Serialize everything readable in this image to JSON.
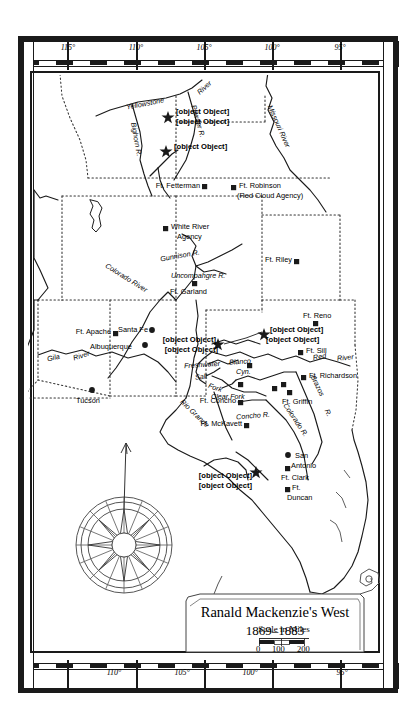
{
  "map": {
    "title": "Ranald Mackenzie's West",
    "date_range": "1869–1883",
    "scale_caption": "Scale in Miles",
    "scale_ticks": [
      "0",
      "100",
      "200"
    ],
    "graticule_top": [
      "115°",
      "110°",
      "105°",
      "100°",
      "95°"
    ],
    "graticule_bottom": [
      "110°",
      "105°",
      "100°",
      "95°"
    ],
    "compass": {
      "name": "compass-rose",
      "points": 16
    },
    "forts": [
      {
        "label": "Ft. Fetterman",
        "marker": "square"
      },
      {
        "label": "Ft. Robinson",
        "marker": "square"
      },
      {
        "label": "(Red Cloud Agency)",
        "marker": "none"
      },
      {
        "label": "White River",
        "marker": "square"
      },
      {
        "label": "Agency",
        "marker": "none"
      },
      {
        "label": "Ft. Riley",
        "marker": "square"
      },
      {
        "label": "Ft. Garland",
        "marker": "square"
      },
      {
        "label": "Ft. Reno",
        "marker": "square"
      },
      {
        "label": "Ft. Apache",
        "marker": "square"
      },
      {
        "label": "Ft. Sill",
        "marker": "square"
      },
      {
        "label": "Ft. Richardson",
        "marker": "square"
      },
      {
        "label": "Ft. Griffin",
        "marker": "square"
      },
      {
        "label": "Ft. Concho",
        "marker": "square"
      },
      {
        "label": "Ft. McKavett",
        "marker": "square"
      },
      {
        "label": "Ft. Clark",
        "marker": "square"
      },
      {
        "label": "Ft.",
        "marker": "square"
      },
      {
        "label": "Duncan",
        "marker": "none"
      }
    ],
    "cities": [
      {
        "label": "Santa Fe",
        "marker": "dot"
      },
      {
        "label": "Albuquerque",
        "marker": "dot"
      },
      {
        "label": "Tucson",
        "marker": "dot"
      },
      {
        "label": "San",
        "marker": "dot"
      },
      {
        "label": "Antonio",
        "marker": "none"
      }
    ],
    "battles": [
      {
        "label": "Custer",
        "marker": "star"
      },
      {
        "label": "fight",
        "marker": "none"
      },
      {
        "label": "Dull Knife fight",
        "marker": "star"
      },
      {
        "label": "Battle of  Palo",
        "marker": "star"
      },
      {
        "label": "Duro Cyn.",
        "marker": "none"
      },
      {
        "label": "Battle of the North",
        "marker": "star"
      },
      {
        "label": "Fork of the Red River",
        "marker": "none"
      },
      {
        "label": "Fight at",
        "marker": "star"
      },
      {
        "label": "El Remolino",
        "marker": "none"
      }
    ],
    "rivers": [
      "Yellowstone",
      "River",
      "Bighorn R.",
      "Powder R.",
      "Missouri River",
      "Colorado River",
      "Gunnison R.",
      "Uncompahgre R.",
      "Gila",
      "River",
      "Rio Grande",
      "Red",
      "River",
      "Freshwater",
      "Salt",
      "Fork",
      "Blanco",
      "Cyn.",
      "Clear Fork",
      "Concho R.",
      "Colorado R.",
      "Brazos",
      "R."
    ]
  }
}
